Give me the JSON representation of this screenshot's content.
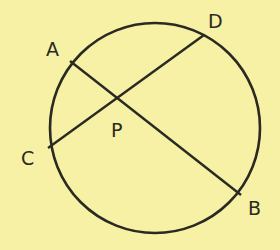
{
  "diagram": {
    "colors": {
      "background": "#f6f1a4",
      "stroke": "#2a2a22"
    },
    "circle": {
      "cx": 155,
      "cy": 128,
      "r": 105
    },
    "points": {
      "A": {
        "label": "A",
        "x": 70,
        "y": 61,
        "lx": 46,
        "ly": 56
      },
      "B": {
        "label": "B",
        "x": 241,
        "y": 195,
        "lx": 248,
        "ly": 215
      },
      "C": {
        "label": "C",
        "x": 48,
        "y": 148,
        "lx": 21,
        "ly": 165
      },
      "D": {
        "label": "D",
        "x": 204,
        "y": 35,
        "lx": 208,
        "ly": 28
      },
      "P": {
        "label": "P",
        "x": 117,
        "y": 96,
        "lx": 111,
        "ly": 137
      }
    },
    "chords": [
      {
        "name": "AB",
        "from": "A",
        "to": "B"
      },
      {
        "name": "CD",
        "from": "C",
        "to": "D"
      }
    ]
  }
}
